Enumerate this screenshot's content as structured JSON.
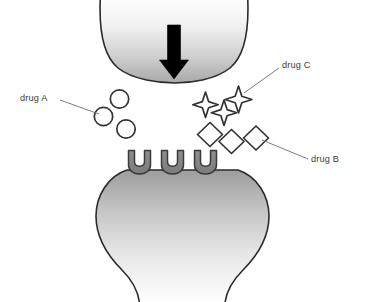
{
  "figure": {
    "background_color": "#ffffff"
  },
  "labels": {
    "drug_a": "drug A",
    "drug_b": "drug B",
    "drug_c": "drug C"
  },
  "elements": {
    "presynaptic_terminal": {
      "name": "presynaptic terminal",
      "fill_top_color": "#ffffff",
      "fill_bottom_color": "#a9a9a9",
      "stroke_color": "#2b2b2b"
    },
    "postsynaptic_cell": {
      "name": "postsynaptic cell",
      "fill_top_color": "#9d9d9d",
      "fill_bottom_color": "#ffffff",
      "stroke_color": "#2b2b2b"
    },
    "release_arrow": {
      "name": "neurotransmitter release arrow",
      "direction": "down",
      "color": "#000000"
    },
    "receptors": {
      "name": "postsynaptic receptors",
      "count": 3,
      "fill_color": "#868686",
      "stroke_color": "#3a3a3a"
    },
    "drug_a_molecules": {
      "name": "drug A molecules",
      "shape": "circle",
      "count": 3,
      "fill_color": "#ffffff",
      "stroke_color": "#333333"
    },
    "drug_b_molecules": {
      "name": "drug B molecules",
      "shape": "diamond",
      "count": 3,
      "fill_color": "#ffffff",
      "stroke_color": "#333333"
    },
    "drug_c_molecules": {
      "name": "drug C molecules",
      "shape": "four-pointed-star",
      "count": 3,
      "fill_color": "#ffffff",
      "stroke_color": "#333333"
    }
  },
  "leader_lines": {
    "drug_a_line": "from drug A label to nearest circle",
    "drug_b_line": "from rightmost diamond to drug B label",
    "drug_c_line": "from topmost star to drug C label"
  }
}
